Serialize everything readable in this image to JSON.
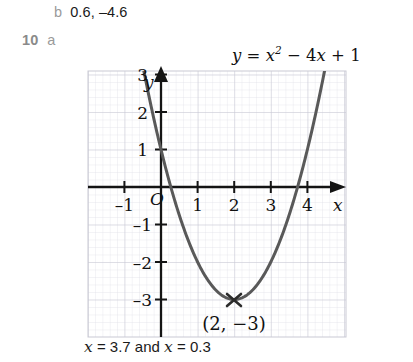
{
  "page": {
    "background": "#ffffff",
    "width": 413,
    "height": 362
  },
  "answers": {
    "prev_part_marker": "b",
    "prev_part_value": "0.6, –4.6",
    "question_number": "10",
    "part_marker": "a",
    "solution_text": "= 3.7 and",
    "solution_var1": "x",
    "solution_var2": "x",
    "solution_tail": "= 0.3"
  },
  "equation": {
    "lhs": "y",
    "eq": "=",
    "term1_base": "x",
    "term1_exp": "2",
    "op1": "−",
    "term2": "4",
    "term2_var": "x",
    "op2": "+",
    "term3": "1",
    "full": "y = x² − 4x + 1"
  },
  "chart_data": {
    "type": "line",
    "xlabel": "x",
    "ylabel": "y",
    "function": "y = x^2 - 4x + 1",
    "xlim": [
      -1.95,
      5.05
    ],
    "ylim": [
      -3.75,
      3.55
    ],
    "xticks": [
      -1,
      1,
      2,
      3,
      4
    ],
    "xtick_labels": [
      "–1",
      "1",
      "2",
      "3",
      "4"
    ],
    "yticks": [
      1,
      2,
      3,
      -1,
      -2,
      -3
    ],
    "ytick_labels": [
      "1",
      "2",
      "3",
      "–1",
      "–2",
      "–3"
    ],
    "origin_label": "O",
    "grid": true,
    "grid_minor_step": 0.2,
    "grid_major_step": 1,
    "curve_color": "#595959",
    "axis_color": "#1a1a1a",
    "grid_minor_color": "#dcdce4",
    "grid_major_color": "#c2c2cf",
    "annotations": [
      {
        "kind": "vertex-cross",
        "x": 2,
        "y": -3,
        "label": "(2, −3)"
      }
    ],
    "points": [
      {
        "x": -1.0,
        "y": 6.0
      },
      {
        "x": -0.5,
        "y": 3.25
      },
      {
        "x": -0.2,
        "y": 1.84
      },
      {
        "x": 0.0,
        "y": 1.0
      },
      {
        "x": 0.268,
        "y": 0.0
      },
      {
        "x": 0.5,
        "y": -0.75
      },
      {
        "x": 1.0,
        "y": -2.0
      },
      {
        "x": 1.5,
        "y": -2.75
      },
      {
        "x": 2.0,
        "y": -3.0
      },
      {
        "x": 2.5,
        "y": -2.75
      },
      {
        "x": 3.0,
        "y": -2.0
      },
      {
        "x": 3.5,
        "y": -0.75
      },
      {
        "x": 3.732,
        "y": 0.0
      },
      {
        "x": 4.0,
        "y": 1.0
      },
      {
        "x": 4.5,
        "y": 2.25
      },
      {
        "x": 4.9,
        "y": 5.41
      }
    ],
    "roots": [
      0.268,
      3.732
    ],
    "vertex": {
      "x": 2,
      "y": -3
    },
    "y_intercept": 1
  }
}
